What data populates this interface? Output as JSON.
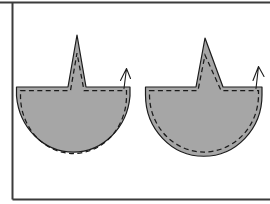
{
  "figure": {
    "background_color": "#ffffff",
    "canvas": {
      "width": 270,
      "height": 204
    },
    "frame": {
      "name": "image-border",
      "stroke_color": "#3b3b3b",
      "top_y": 2.5,
      "left_x": 12.5,
      "bottom_y": 199.5,
      "left_extends_from_y": 2.5,
      "left_extends_to_y": 199.5,
      "top_extends_from_x": 0,
      "top_extends_to_x": 270,
      "bottom_extends_from_x": 12.5,
      "bottom_extends_to_x": 270
    },
    "pieces": [
      {
        "id": "piece-left",
        "label": "Left pattern piece",
        "fill_color": "#a6a6a6",
        "outline_color": "#1c1c1c",
        "stitch_color": "#1a1a1a",
        "stitch_style": "dashed",
        "dart_peak": {
          "x": 77,
          "y": 35
        },
        "top_edge_y": 87,
        "left_x": 16,
        "right_x": 130,
        "bottom_y": 156,
        "thread_mark": {
          "x": 126,
          "y": 72,
          "label": "thread-tail-mark"
        },
        "outline_path": "M 16.5 87 L 68 87 L 77 35 L 86 87 L 130 87 L 130 96 A 57 62 0 0 1 16.5 96 Z",
        "stitch_path": "M 20.5 90.5 L 70.5 90.5 L 77 53 L 84 90.5 L 126.5 90.5 L 126.5 96 A 53 57.5 0 0 1 20.5 96 Z",
        "thread_path": "M 120.5 80.5 L 126.5 68.5 M 126.5 68.5 L 130.5 78.5 M 126.5 68.5 L 124 88.5"
      },
      {
        "id": "piece-right",
        "label": "Right pattern piece",
        "fill_color": "#a6a6a6",
        "outline_color": "#1c1c1c",
        "stitch_color": "#1a1a1a",
        "stitch_style": "dashed",
        "dart_peak": {
          "x": 205,
          "y": 38
        },
        "top_edge_y": 87,
        "left_x": 145,
        "right_x": 262,
        "bottom_y": 155,
        "thread_mark": {
          "x": 258,
          "y": 70,
          "label": "thread-tail-mark"
        },
        "outline_path": "M 145.5 87 L 196 87 L 205 38 L 223 87 L 262 87 L 262 95 A 58 61 0 0 1 145.5 95 Z",
        "stitch_path": "M 149.5 90.5 L 198 90.5 L 205 55 L 221 90.5 L 258.5 90.5 L 258.5 95 A 54 56.5 0 0 1 149.5 95 Z",
        "thread_path": "M 253 80.5 L 258.5 66.5 M 258.5 66.5 L 264 76.5 M 258.5 66.5 L 256 88.5"
      }
    ]
  }
}
